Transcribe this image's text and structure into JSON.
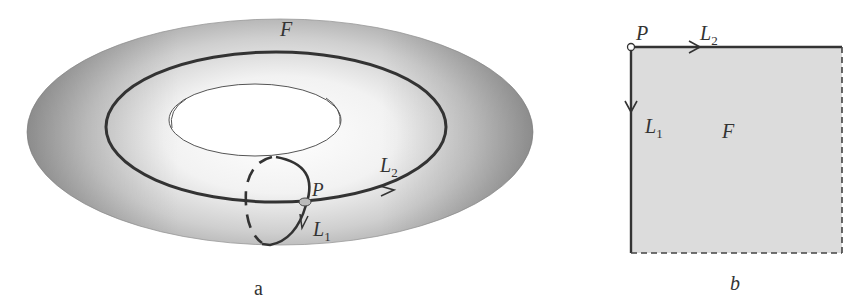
{
  "figure_a": {
    "caption": "a",
    "surface_label": "F",
    "point_label": "P",
    "loop1_label": "L",
    "loop1_sub": "1",
    "loop2_label": "L",
    "loop2_sub": "2",
    "shape": "torus"
  },
  "figure_b": {
    "caption": "b",
    "surface_label": "F",
    "point_label": "P",
    "loop1_label": "L",
    "loop1_sub": "1",
    "loop2_label": "L",
    "loop2_sub": "2",
    "shape": "square"
  },
  "colors": {
    "stroke": "#333333",
    "torus_dark": "#a8a8a8",
    "torus_light": "#f4f4f4",
    "square_fill": "#dcdcdc"
  }
}
